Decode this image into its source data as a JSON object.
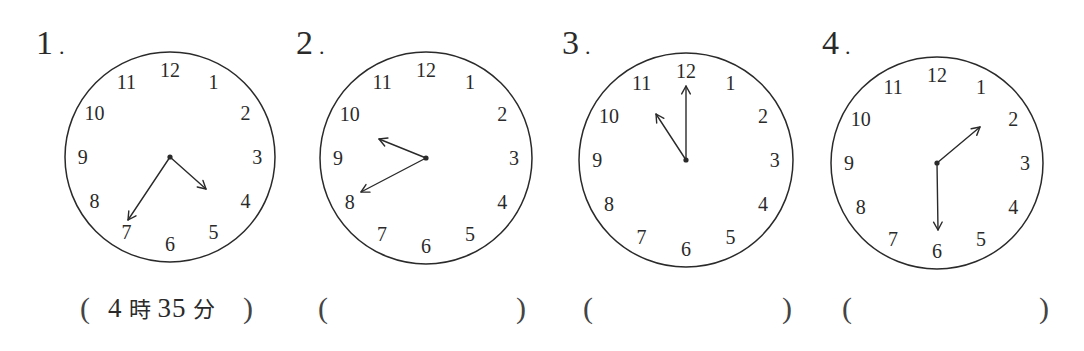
{
  "worksheet": {
    "problems": [
      {
        "number": "1",
        "clock": {
          "numerals": [
            "12",
            "1",
            "2",
            "3",
            "4",
            "5",
            "6",
            "7",
            "8",
            "9",
            "10",
            "11"
          ],
          "hour_hand": {
            "points_toward": "between 4 and 5",
            "hour": 4,
            "minute": 35
          },
          "minute_hand": {
            "points_toward": "7",
            "minute": 35
          }
        },
        "answer": {
          "open": "(",
          "hour": "4",
          "hour_unit": "時",
          "minute": "35",
          "minute_unit": "分",
          "close": ")"
        }
      },
      {
        "number": "2",
        "clock": {
          "numerals": [
            "12",
            "1",
            "2",
            "3",
            "4",
            "5",
            "6",
            "7",
            "8",
            "9",
            "10",
            "11"
          ],
          "hour_hand": {
            "points_toward": "between 9 and 10",
            "hour": 9,
            "minute": 40
          },
          "minute_hand": {
            "points_toward": "8",
            "minute": 40
          }
        },
        "answer": {
          "open": "(",
          "value": "",
          "close": ")"
        }
      },
      {
        "number": "3",
        "clock": {
          "numerals": [
            "12",
            "1",
            "2",
            "3",
            "4",
            "5",
            "6",
            "7",
            "8",
            "9",
            "10",
            "11"
          ],
          "hour_hand": {
            "points_toward": "11",
            "hour": 11,
            "minute": 0
          },
          "minute_hand": {
            "points_toward": "12",
            "minute": 0
          }
        },
        "answer": {
          "open": "(",
          "value": "",
          "close": ")"
        }
      },
      {
        "number": "4",
        "clock": {
          "numerals": [
            "12",
            "1",
            "2",
            "3",
            "4",
            "5",
            "6",
            "7",
            "8",
            "9",
            "10",
            "11"
          ],
          "hour_hand": {
            "points_toward": "between 1 and 2",
            "hour": 1,
            "minute": 30
          },
          "minute_hand": {
            "points_toward": "6",
            "minute": 30
          }
        },
        "answer": {
          "open": "(",
          "value": "",
          "close": ")"
        }
      }
    ]
  },
  "layout_clocks": [
    {
      "cx": 170,
      "cy": 157,
      "r": 105,
      "hour_tip": [
        206,
        189
      ],
      "minute_tip": [
        128,
        220
      ]
    },
    {
      "cx": 426,
      "cy": 158,
      "r": 106,
      "hour_tip": [
        379,
        139
      ],
      "minute_tip": [
        361,
        192
      ]
    },
    {
      "cx": 686,
      "cy": 160,
      "r": 107,
      "hour_tip": [
        656,
        114
      ],
      "minute_tip": [
        686,
        86
      ]
    },
    {
      "cx": 937,
      "cy": 163,
      "r": 106,
      "hour_tip": [
        980,
        127
      ],
      "minute_tip": [
        938,
        230
      ]
    }
  ],
  "colors": {
    "ink": "#2a2a2a",
    "face": "#ffffff"
  }
}
